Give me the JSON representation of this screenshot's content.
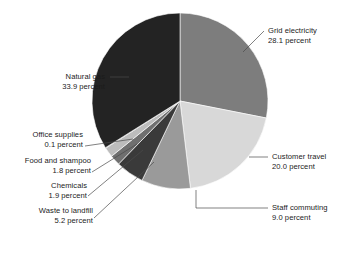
{
  "chart_data": {
    "type": "pie",
    "title": "",
    "units": "percent",
    "start_angle_deg": 0,
    "direction": "clockwise",
    "legend": "labels-with-leader-lines",
    "categories": [
      "Grid electricity",
      "Customer travel",
      "Staff commuting",
      "Waste to landfill",
      "Chemicals",
      "Food and shampoo",
      "Office supplies",
      "Natural gas"
    ],
    "values": [
      28.1,
      20.0,
      9.0,
      5.2,
      1.9,
      1.8,
      0.1,
      33.9
    ],
    "value_suffix": "percent",
    "colors": [
      "#7d7d7d",
      "#d8d8d8",
      "#9a9a9a",
      "#3a3a3a",
      "#6f6f6f",
      "#bcbcbc",
      "#8a8a8a",
      "#232323"
    ],
    "slices": [
      {
        "label": "Grid electricity",
        "value": 28.1,
        "value_text": "28.1 percent",
        "color": "#7d7d7d",
        "side": "right"
      },
      {
        "label": "Customer travel",
        "value": 20.0,
        "value_text": "20.0 percent",
        "color": "#d8d8d8",
        "side": "right"
      },
      {
        "label": "Staff commuting",
        "value": 9.0,
        "value_text": "9.0 percent",
        "color": "#9a9a9a",
        "side": "right"
      },
      {
        "label": "Waste to landfill",
        "value": 5.2,
        "value_text": "5.2 percent",
        "color": "#3a3a3a",
        "side": "left"
      },
      {
        "label": "Chemicals",
        "value": 1.9,
        "value_text": "1.9 percent",
        "color": "#6f6f6f",
        "side": "left"
      },
      {
        "label": "Food and shampoo",
        "value": 1.8,
        "value_text": "1.8 percent",
        "color": "#bcbcbc",
        "side": "left"
      },
      {
        "label": "Office supplies",
        "value": 0.1,
        "value_text": "0.1 percent",
        "color": "#8a8a8a",
        "side": "left"
      },
      {
        "label": "Natural gas",
        "value": 33.9,
        "value_text": "33.9 percent",
        "color": "#232323",
        "side": "left"
      }
    ]
  },
  "labels": {
    "grid_electricity": {
      "name": "Grid electricity",
      "value": "28.1 percent"
    },
    "customer_travel": {
      "name": "Customer travel",
      "value": "20.0 percent"
    },
    "staff_commuting": {
      "name": "Staff commuting",
      "value": "9.0 percent"
    },
    "natural_gas": {
      "name": "Natural gas",
      "value": "33.9 percent"
    },
    "office_supplies": {
      "name": "Office supplies",
      "value": "0.1 percent"
    },
    "food_and_shampoo": {
      "name": "Food and shampoo",
      "value": "1.8 percent"
    },
    "chemicals": {
      "name": "Chemicals",
      "value": "1.9 percent"
    },
    "waste_to_landfill": {
      "name": "Waste to landfill",
      "value": "5.2 percent"
    }
  }
}
